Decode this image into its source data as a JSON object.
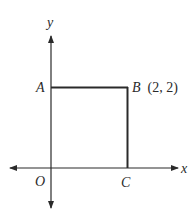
{
  "diagram": {
    "type": "coordinate-geometry",
    "axes": {
      "x": {
        "label": "x"
      },
      "y": {
        "label": "y"
      }
    },
    "points": [
      {
        "name": "O",
        "label": "O",
        "coords": [
          0,
          0
        ]
      },
      {
        "name": "A",
        "label": "A",
        "coords": [
          0,
          2
        ]
      },
      {
        "name": "B",
        "label": "B",
        "coords_label": "(2, 2)",
        "coords": [
          2,
          2
        ]
      },
      {
        "name": "C",
        "label": "C",
        "coords": [
          2,
          0
        ]
      }
    ],
    "shape": "square",
    "colors": {
      "line": "#2a2a2a",
      "background": "#ffffff"
    }
  }
}
